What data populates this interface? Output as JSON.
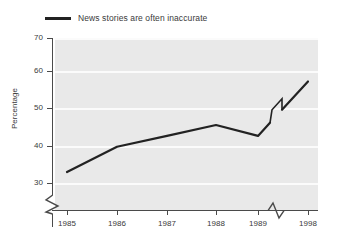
{
  "chart_data": {
    "type": "line",
    "title": "",
    "xlabel": "",
    "ylabel": "Percentage",
    "categories": [
      "1985",
      "1986",
      "1987",
      "1988",
      "1989",
      "1998"
    ],
    "x": [
      1985,
      1986,
      1987,
      1988,
      1989,
      1998
    ],
    "values": [
      33,
      40,
      43,
      46,
      43,
      58
    ],
    "series": [
      {
        "name": "News stories are often inaccurate",
        "values": [
          33,
          40,
          43,
          46,
          43,
          58
        ],
        "color": "#222222"
      }
    ],
    "ylim": [
      25,
      70
    ],
    "yticks": [
      30,
      40,
      50,
      60,
      70
    ],
    "ytick_labels": [
      "30",
      "40",
      "50",
      "60",
      "70"
    ],
    "xtick_labels": [
      "1985",
      "1986",
      "1987",
      "1988",
      "1989",
      "1998"
    ],
    "grid": true,
    "grid_color": "#fbfbfb",
    "plot_background": "#e9e9e9",
    "legend_position": "top-left",
    "axis_break_y": true,
    "axis_break_x": true,
    "axis_break_x_between": [
      "1989",
      "1998"
    ],
    "line_break_marker": true,
    "annotations": []
  },
  "legend": {
    "label": "News stories are often inaccurate",
    "swatch_color": "#222222"
  },
  "axes": {
    "y_title": "Percentage",
    "y_labels": [
      "70",
      "60",
      "50",
      "40",
      "30"
    ],
    "x_labels": [
      "1985",
      "1986",
      "1987",
      "1988",
      "1989",
      "1998"
    ]
  }
}
